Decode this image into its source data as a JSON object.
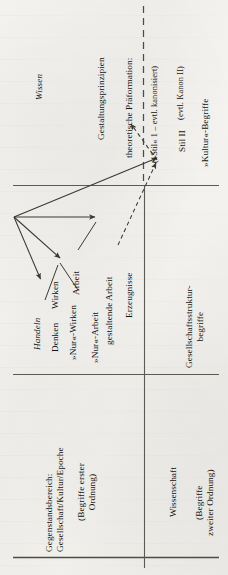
{
  "figure": {
    "title_implicit": "Schema: Gegenstandsbereich und Wissenschaft",
    "axis_labels": {
      "wissen": "Wissen",
      "handeln": "Handeln"
    },
    "quadrants": {
      "object_domain_title_line1": "Gegenstandsbereich:",
      "object_domain_title_line2": "Gesellschaft/Kultur/Epoche",
      "object_domain_sub_line1": "(Begriffe erster",
      "object_domain_sub_line2": "Ordnung)",
      "science_title": "Wissenschaft",
      "science_sub_line1": "(Begriffe",
      "science_sub_line2": "zweiter Ordnung)"
    },
    "nodes": {
      "denken": "Denken",
      "wirken": "Wirken",
      "nur_wirken": "»Nur«-Wirken",
      "arbeit": "Arbeit",
      "nur_arbeit": "»Nur«-Arbeit",
      "gestaltende_arbeit": "gestaltende Arbeit",
      "erzeugnisse": "Erzeugnisse",
      "gestaltungsprinzipien": "Gestaltungsprinzipien",
      "theoretische_praeformation": "theoretische Präformation:",
      "stil_1_kanonisiert": "(»Stil« 1 – evtl. kanonisiert)",
      "stil_2": "Stil II",
      "kanon_2": "(evtl. Kanon II)",
      "kultur_begriffe": "»Kultur«-Begriffe",
      "gesellschaftsstruktur_line1": "Gesellschaftsstruktur-",
      "gesellschaftsstruktur_line2": "begriffe"
    },
    "colors": {
      "paper": "#f3f2ef",
      "ink": "#14120f",
      "rule": "#5d5a54",
      "arrow": "#3b3833"
    },
    "rules": {
      "horizontal_top": "solid",
      "horizontal_bottom": "solid",
      "vertical_divider": "solid",
      "vertical_dashed": "dashed"
    }
  }
}
